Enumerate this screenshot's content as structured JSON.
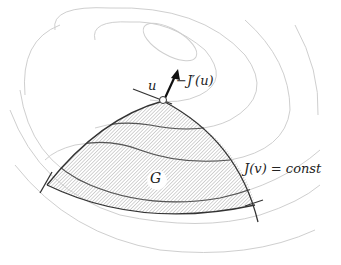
{
  "diagram": {
    "labels": {
      "point": "u",
      "gradient": "−J′(u)",
      "region": "G",
      "level_set": "J(v) = const"
    },
    "colors": {
      "contour": "#c8c8c8",
      "boundary": "#333333",
      "hatch": "#9a9a9a",
      "arrow": "#111111"
    }
  }
}
